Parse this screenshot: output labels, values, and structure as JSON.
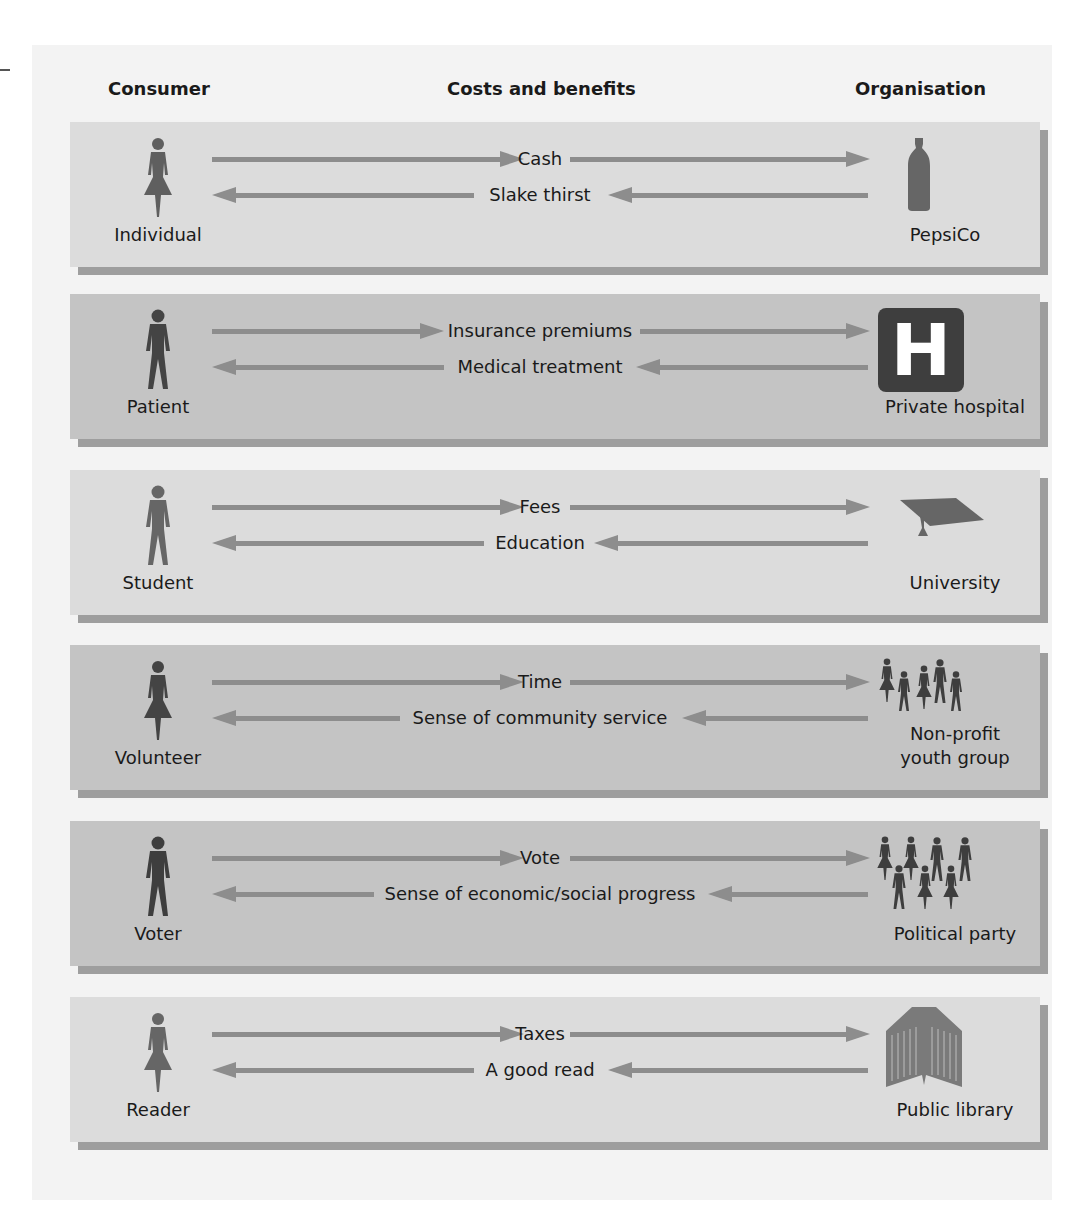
{
  "headers": {
    "consumer": "Consumer",
    "costs_benefits": "Costs and benefits",
    "organisation": "Organisation"
  },
  "colors": {
    "panel_light": "#dcdcdc",
    "panel_dark": "#c4c4c4",
    "shadow": "#9e9e9e",
    "arrow": "#8d8d8d",
    "icon": "#5a5a5a"
  },
  "rows": [
    {
      "consumer": "Individual",
      "consumer_icon": "woman-icon",
      "cost": "Cash",
      "benefit": "Slake thirst",
      "organisation": "PepsiCo",
      "organisation_icon": "bottle-icon"
    },
    {
      "consumer": "Patient",
      "consumer_icon": "man-icon",
      "cost": "Insurance premiums",
      "benefit": "Medical treatment",
      "organisation": "Private hospital",
      "organisation_icon": "hospital-icon",
      "hospital_glyph": "H"
    },
    {
      "consumer": "Student",
      "consumer_icon": "man-icon",
      "cost": "Fees",
      "benefit": "Education",
      "organisation": "University",
      "organisation_icon": "mortarboard-icon"
    },
    {
      "consumer": "Volunteer",
      "consumer_icon": "woman-icon",
      "cost": "Time",
      "benefit": "Sense of community service",
      "organisation_line1": "Non-profit",
      "organisation_line2": "youth group",
      "organisation_icon": "group-of-people-icon"
    },
    {
      "consumer": "Voter",
      "consumer_icon": "man-icon",
      "cost": "Vote",
      "benefit": "Sense of economic/social progress",
      "organisation": "Political party",
      "organisation_icon": "crowd-icon"
    },
    {
      "consumer": "Reader",
      "consumer_icon": "woman-icon",
      "cost": "Taxes",
      "benefit": "A good read",
      "organisation": "Public library",
      "organisation_icon": "open-book-icon"
    }
  ]
}
